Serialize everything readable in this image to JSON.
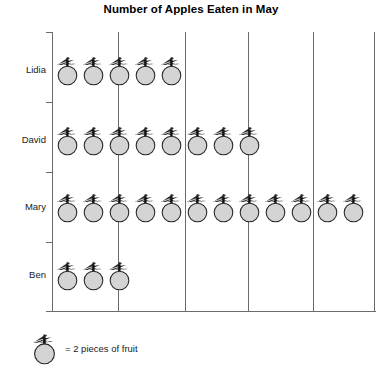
{
  "chart_data": {
    "type": "bar",
    "title": "Number of Apples Eaten in May",
    "subtitle": "",
    "xlabel": "",
    "ylabel": "",
    "categories": [
      "Lidia",
      "David",
      "Mary",
      "Ben"
    ],
    "icon_counts": [
      5,
      8,
      12,
      3
    ],
    "values": [
      10,
      16,
      24,
      6
    ],
    "unit_label": "pieces of fruit",
    "icons_per_unit": 2,
    "icon_name": "apple-icon",
    "legend": "= 2 pieces of fruit",
    "legend_position": "bottom-left",
    "grid": true,
    "gridline_interval_icons": 2.5,
    "xlim": [
      0,
      24
    ]
  },
  "chart": {
    "title": "Number of Apples Eaten in May",
    "rows": [
      {
        "label": "Lidia",
        "icons": 5,
        "total": 10
      },
      {
        "label": "David",
        "icons": 8,
        "total": 16
      },
      {
        "label": "Mary",
        "icons": 12,
        "total": 24
      },
      {
        "label": "Ben",
        "icons": 3,
        "total": 6
      }
    ],
    "legend": {
      "icon": "apple-icon",
      "text": "= 2 pieces of fruit"
    },
    "colors": {
      "apple_fill": "#d4d4d4",
      "apple_stroke": "#2b2b2b",
      "stem": "#111111",
      "axis": "#6b6b6b",
      "text": "#1a1a1a",
      "background": "#ffffff"
    }
  }
}
